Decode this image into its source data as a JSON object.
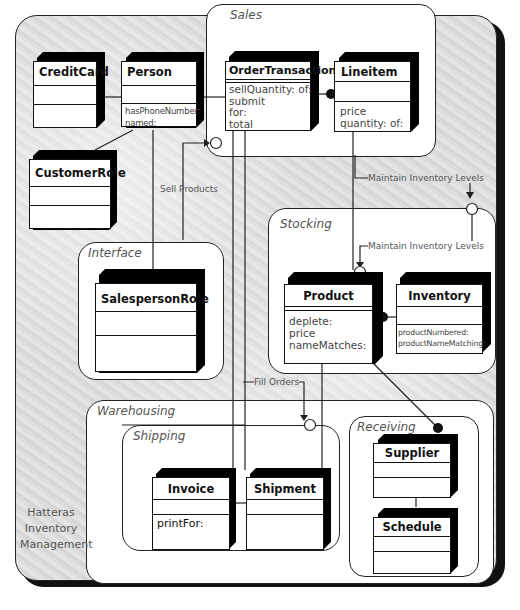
{
  "diagram": {
    "title_lines": [
      "Hatteras",
      "Inventory",
      "Management"
    ],
    "packages": {
      "sales": "Sales",
      "interface": "Interface",
      "stocking": "Stocking",
      "warehousing": "Warehousing",
      "shipping": "Shipping",
      "receiving": "Receiving"
    },
    "classes": {
      "creditcard": {
        "name": "CreditCard",
        "operations": []
      },
      "person": {
        "name": "Person",
        "operations": [
          "hasPhoneNumber:",
          "named:"
        ]
      },
      "customerrole": {
        "name": "CustomerRole",
        "operations": []
      },
      "ordertransaction": {
        "name": "OrderTransaction",
        "operations": [
          "sellQuantity: of:",
          "submit",
          "for:",
          "total"
        ]
      },
      "lineitem": {
        "name": "Lineitem",
        "operations": [
          "price",
          "quantity: of:"
        ]
      },
      "salespersonrole": {
        "name": "SalespersonRole",
        "operations": []
      },
      "product": {
        "name": "Product",
        "operations": [
          "deplete:",
          "price",
          "nameMatches:"
        ]
      },
      "inventory": {
        "name": "Inventory",
        "operations": [
          "productNumbered:",
          "productNameMatching:"
        ]
      },
      "invoice": {
        "name": "Invoice",
        "operations": [
          "printFor:"
        ]
      },
      "shipment": {
        "name": "Shipment",
        "operations": []
      },
      "supplier": {
        "name": "Supplier",
        "operations": []
      },
      "schedule": {
        "name": "Schedule",
        "operations": []
      }
    },
    "collaborations": {
      "sell_products": "Sell Products",
      "maintain_inventory_1": "Maintain Inventory Levels",
      "maintain_inventory_2": "Maintain Inventory Levels",
      "fill_orders": "Fill Orders"
    }
  }
}
